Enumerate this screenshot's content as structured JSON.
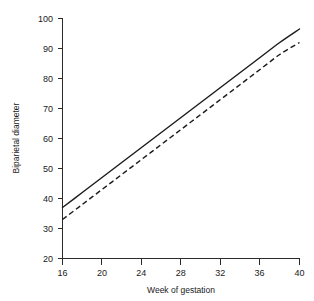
{
  "chart_data": {
    "type": "line",
    "title": "",
    "xlabel": "Week of gestation",
    "ylabel": "Biparietal diameter",
    "xlim": [
      16,
      40
    ],
    "ylim": [
      20,
      100
    ],
    "xticks": [
      16,
      20,
      24,
      28,
      32,
      36,
      40
    ],
    "yticks": [
      20,
      30,
      40,
      50,
      60,
      70,
      80,
      90,
      100
    ],
    "grid": false,
    "legend": "none",
    "x": [
      16,
      18,
      20,
      22,
      24,
      26,
      28,
      30,
      32,
      34,
      36,
      38,
      40
    ],
    "series": [
      {
        "name": "upper-percentile",
        "style": "solid",
        "color": "#1c1c1c",
        "values": [
          37.0,
          42.0,
          47.0,
          52.0,
          57.0,
          62.0,
          67.0,
          72.0,
          77.0,
          82.0,
          87.0,
          92.0,
          96.5
        ]
      },
      {
        "name": "lower-percentile",
        "style": "dashed",
        "color": "#1c1c1c",
        "values": [
          33.0,
          38.0,
          43.0,
          48.0,
          53.0,
          58.0,
          63.0,
          68.0,
          73.0,
          78.0,
          83.0,
          88.0,
          92.0
        ]
      }
    ],
    "xtick_labels": [
      "16",
      "20",
      "24",
      "28",
      "32",
      "36",
      "40"
    ],
    "ytick_labels": [
      "20",
      "30",
      "40",
      "50",
      "60",
      "70",
      "80",
      "90",
      "100"
    ]
  },
  "labels": {
    "y100": "100",
    "y90": "90",
    "y80": "80",
    "y70": "70",
    "y60": "60",
    "y50": "50",
    "y40": "40",
    "y30": "30",
    "y20": "20",
    "x16": "16",
    "x20": "20",
    "x24": "24",
    "x28": "28",
    "x32": "32",
    "x36": "36",
    "x40": "40",
    "xaxis_title": "Week of gestation",
    "yaxis_title": "Biparietal diameter"
  }
}
